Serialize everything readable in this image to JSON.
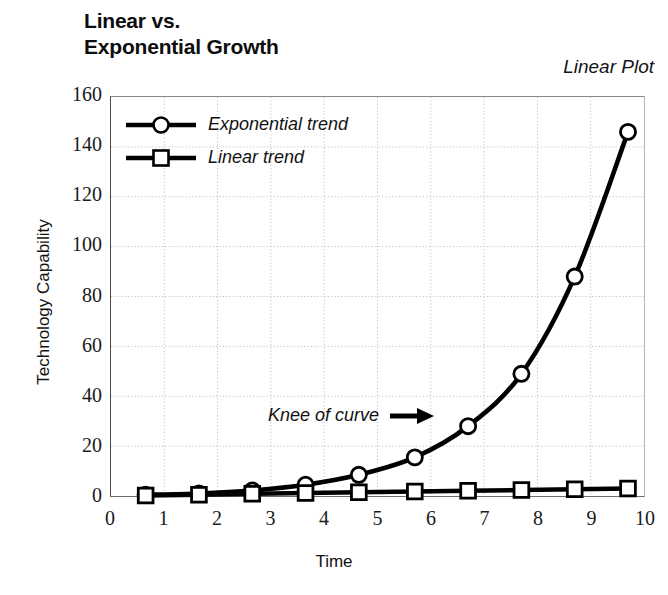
{
  "chart_data": {
    "type": "line",
    "title": "Linear vs.\nExponential Growth",
    "corner_label": "Linear Plot",
    "xlabel": "Time",
    "ylabel": "Technology Capability",
    "xlim": [
      0,
      10
    ],
    "ylim": [
      0,
      160
    ],
    "xticks": [
      "0",
      "1",
      "2",
      "3",
      "4",
      "5",
      "6",
      "7",
      "8",
      "9",
      "10"
    ],
    "yticks": [
      "0",
      "20",
      "40",
      "60",
      "80",
      "100",
      "120",
      "140",
      "160"
    ],
    "grid": "dotted-both-axes",
    "legend_position": "top-left-inside",
    "series": [
      {
        "name": "Exponential trend",
        "marker": "circle",
        "color": "#000000",
        "x": [
          0.65,
          1.65,
          2.65,
          3.65,
          4.65,
          5.7,
          6.7,
          7.7,
          8.7,
          9.7
        ],
        "values": [
          0.5,
          1.0,
          2.2,
          4.5,
          8.5,
          15.5,
          28.0,
          49.0,
          88.0,
          146.0
        ]
      },
      {
        "name": "Linear trend",
        "marker": "square",
        "color": "#000000",
        "x": [
          0.65,
          1.65,
          2.65,
          3.65,
          4.65,
          5.7,
          6.7,
          7.7,
          8.7,
          9.7
        ],
        "values": [
          0.2,
          0.5,
          0.9,
          1.2,
          1.5,
          1.8,
          2.1,
          2.4,
          2.7,
          3.0
        ]
      }
    ],
    "annotations": [
      {
        "text": "Knee of curve",
        "arrow": "right-arrow",
        "points_to_x": 6.7,
        "points_to_y": 28.0
      }
    ]
  }
}
